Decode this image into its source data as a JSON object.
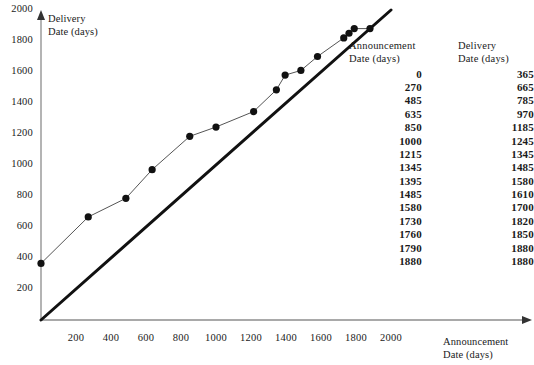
{
  "chart_data": {
    "type": "scatter",
    "title": "",
    "xlabel": "Announcement Date (days)",
    "ylabel": "Delivery Date (days)",
    "xlim": [
      0,
      2100
    ],
    "ylim": [
      0,
      2100
    ],
    "xticks": [
      200,
      400,
      600,
      800,
      1000,
      1200,
      1400,
      1600,
      1800,
      2000
    ],
    "yticks": [
      200,
      400,
      600,
      800,
      1000,
      1200,
      1400,
      1600,
      1800,
      2000
    ],
    "grid": false,
    "legend": "none",
    "marker": "filled-circle",
    "marker_color": "#111111",
    "line_color": "#555555",
    "reference_line": {
      "name": "identity-line",
      "from": [
        0,
        0
      ],
      "to": [
        2000,
        2000
      ],
      "color": "#111111",
      "width": 3
    },
    "x": [
      0,
      270,
      485,
      635,
      850,
      1000,
      1215,
      1345,
      1395,
      1485,
      1580,
      1730,
      1760,
      1790,
      1880
    ],
    "y": [
      365,
      665,
      785,
      970,
      1185,
      1245,
      1345,
      1485,
      1580,
      1610,
      1700,
      1820,
      1850,
      1880,
      1880
    ],
    "points": [
      {
        "x": 0,
        "y": 365
      },
      {
        "x": 270,
        "y": 665
      },
      {
        "x": 485,
        "y": 785
      },
      {
        "x": 635,
        "y": 970
      },
      {
        "x": 850,
        "y": 1185
      },
      {
        "x": 1000,
        "y": 1245
      },
      {
        "x": 1215,
        "y": 1345
      },
      {
        "x": 1345,
        "y": 1485
      },
      {
        "x": 1395,
        "y": 1580
      },
      {
        "x": 1485,
        "y": 1610
      },
      {
        "x": 1580,
        "y": 1700
      },
      {
        "x": 1730,
        "y": 1820
      },
      {
        "x": 1760,
        "y": 1850
      },
      {
        "x": 1790,
        "y": 1880
      },
      {
        "x": 1880,
        "y": 1880
      }
    ]
  },
  "axes": {
    "y_title": "Delivery\nDate (days)",
    "x_title": "Announcement\nDate (days)",
    "y_tick_labels": [
      "2000",
      "1800",
      "1600",
      "1400",
      "1200",
      "1000",
      "800",
      "600",
      "400",
      "200"
    ],
    "x_tick_labels": [
      "200",
      "400",
      "600",
      "800",
      "1000",
      "1200",
      "1400",
      "1600",
      "1800",
      "2000"
    ]
  },
  "table": {
    "headers": {
      "announcement": "Announcement\nDate (days)",
      "delivery": "Delivery\nDate (days)"
    },
    "rows": [
      {
        "announcement": "0",
        "delivery": "365"
      },
      {
        "announcement": "270",
        "delivery": "665"
      },
      {
        "announcement": "485",
        "delivery": "785"
      },
      {
        "announcement": "635",
        "delivery": "970"
      },
      {
        "announcement": "850",
        "delivery": "1185"
      },
      {
        "announcement": "1000",
        "delivery": "1245"
      },
      {
        "announcement": "1215",
        "delivery": "1345"
      },
      {
        "announcement": "1345",
        "delivery": "1485"
      },
      {
        "announcement": "1395",
        "delivery": "1580"
      },
      {
        "announcement": "1485",
        "delivery": "1610"
      },
      {
        "announcement": "1580",
        "delivery": "1700"
      },
      {
        "announcement": "1730",
        "delivery": "1820"
      },
      {
        "announcement": "1760",
        "delivery": "1850"
      },
      {
        "announcement": "1790",
        "delivery": "1880"
      },
      {
        "announcement": "1880",
        "delivery": "1880"
      }
    ]
  }
}
